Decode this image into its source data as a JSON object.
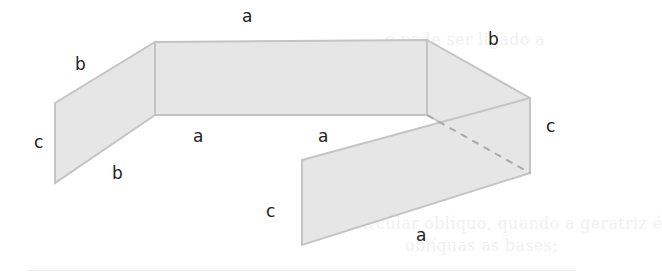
{
  "background_text": [
    "o pode ser ligado a",
    "o cilindro pode ser:",
    "Circular oblíquo, quando a geratriz é",
    "oblíquas as bases;"
  ],
  "figure": {
    "fill": "#e6e6e6",
    "stroke": "#c4c4c4",
    "dashed_edge": "#a9a9a9",
    "panels": [
      {
        "name": "left-panel",
        "points": "55,103 155,42 155,115 55,183"
      },
      {
        "name": "center-panel",
        "points": "155,42 427,40 427,115 155,115"
      },
      {
        "name": "right-back-panel",
        "points": "427,40 530,98 530,173 427,115"
      },
      {
        "name": "front-panel",
        "points": "302,160 530,98 530,173 302,245"
      }
    ],
    "labels": {
      "top_a": "a",
      "left_top_b": "b",
      "right_top_b": "b",
      "left_c": "c",
      "left_bottom_b": "b",
      "center_bottom_a": "a",
      "mid_a": "a",
      "right_c": "c",
      "front_left_c": "c",
      "front_bottom_a": "a"
    }
  }
}
